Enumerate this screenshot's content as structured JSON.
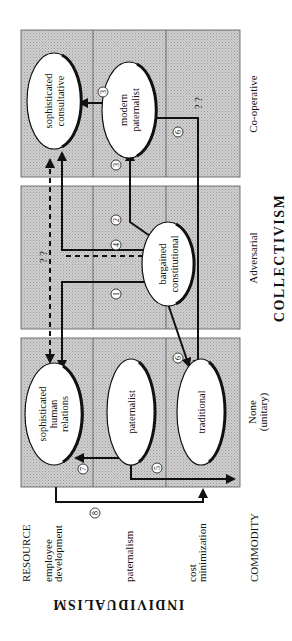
{
  "diagram": {
    "orientation": "rotated 90deg clockwise (text reads bottom-to-top)",
    "axes": {
      "collectivism": {
        "title": "COLLECTIVISM",
        "columns": [
          {
            "label": "Co-operative"
          },
          {
            "label": "Adversarial"
          },
          {
            "label_line1": "None",
            "label_line2": "(unitary)"
          }
        ]
      },
      "individualism": {
        "title": "INDIVIDUALISM",
        "top_label": "RESOURCE",
        "bottom_label": "COMMODITY",
        "rows": [
          {
            "label_line1": "employee",
            "label_line2": "development"
          },
          {
            "label_line1": "paternalism",
            "label_line2": ""
          },
          {
            "label_line1": "cost",
            "label_line2": "minimization"
          }
        ]
      }
    },
    "nodes": {
      "soph_consultative": {
        "line1": "sophisticated",
        "line2": "consultative"
      },
      "modern_paternalist": {
        "line1": "modern",
        "line2": "paternalist"
      },
      "bargained_constitutional": {
        "line1": "bargained",
        "line2": "constitutional"
      },
      "soph_human_relations": {
        "line1": "sophisticated",
        "line2": "human",
        "line3": "relations"
      },
      "paternalist": {
        "line1": "paternalist"
      },
      "traditional": {
        "line1": "traditional"
      }
    },
    "unknown_marks": {
      "cooperative_cost": "? ?",
      "dashed_path": "? ?"
    },
    "path_numbers": [
      "1",
      "2",
      "3",
      "3",
      "4",
      "5",
      "6",
      "6",
      "7",
      "8"
    ],
    "colors": {
      "panel_fill": "#c9c9c9",
      "line": "#111111",
      "node_fill": "#ffffff"
    }
  }
}
